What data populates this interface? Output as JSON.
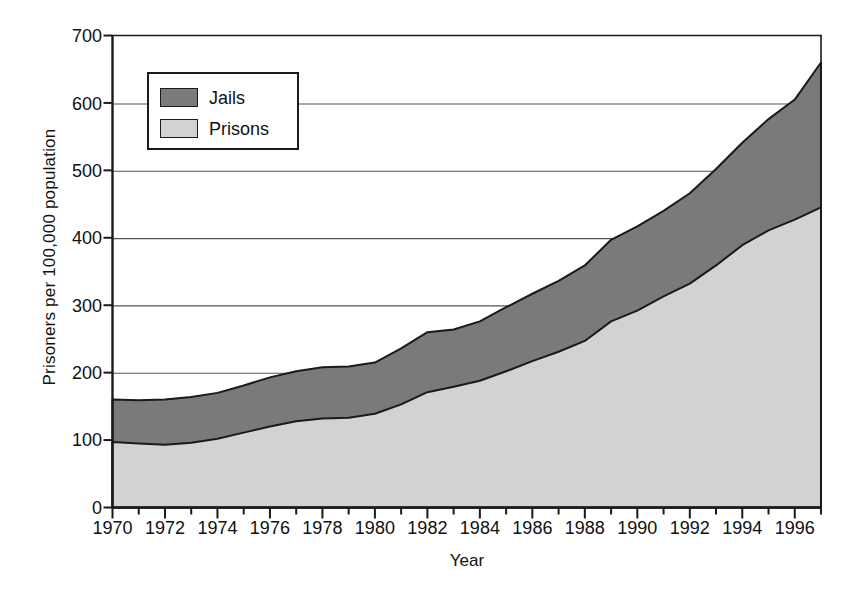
{
  "chart_data": {
    "type": "area",
    "title": "",
    "xlabel": "Year",
    "ylabel": "Prisoners per 100,000 population",
    "xlim": [
      1970,
      1997
    ],
    "ylim": [
      0,
      700
    ],
    "yticks": [
      0,
      100,
      200,
      300,
      400,
      500,
      600,
      700
    ],
    "xticks": [
      1970,
      1972,
      1974,
      1976,
      1978,
      1980,
      1982,
      1984,
      1986,
      1988,
      1990,
      1992,
      1994,
      1996
    ],
    "xtick_labels": [
      "1970",
      "1972",
      "1974",
      "1976",
      "1978",
      "1980",
      "1982",
      "1984",
      "1986",
      "1988",
      "1990",
      "1992",
      "1994",
      "1996"
    ],
    "ytick_labels": [
      "0",
      "100",
      "200",
      "300",
      "400",
      "500",
      "600",
      "700"
    ],
    "grid": "horizontal",
    "stacked": true,
    "legend_position": "top-left-inside",
    "x": [
      1970,
      1971,
      1972,
      1973,
      1974,
      1975,
      1976,
      1977,
      1978,
      1979,
      1980,
      1981,
      1982,
      1983,
      1984,
      1985,
      1986,
      1987,
      1988,
      1989,
      1990,
      1991,
      1992,
      1993,
      1994,
      1995,
      1996,
      1997
    ],
    "series": [
      {
        "name": "Prisons",
        "color": "#d2d2d2",
        "values": [
          97,
          95,
          93,
          96,
          102,
          111,
          120,
          128,
          132,
          133,
          139,
          153,
          171,
          179,
          188,
          202,
          217,
          231,
          247,
          276,
          292,
          313,
          332,
          359,
          389,
          411,
          427,
          445
        ]
      },
      {
        "name": "Jails",
        "color": "#7a7a7a",
        "values": [
          63,
          64,
          67,
          68,
          68,
          70,
          73,
          74,
          76,
          76,
          76,
          83,
          89,
          85,
          88,
          95,
          100,
          105,
          112,
          121,
          125,
          127,
          134,
          143,
          152,
          165,
          178,
          215
        ]
      }
    ],
    "totals": [
      160,
      159,
      160,
      164,
      170,
      181,
      193,
      202,
      208,
      209,
      215,
      236,
      260,
      264,
      276,
      297,
      317,
      336,
      359,
      397,
      417,
      440,
      466,
      502,
      541,
      576,
      605,
      660
    ]
  },
  "legend": {
    "items": [
      {
        "label": "Jails",
        "color": "#7a7a7a"
      },
      {
        "label": "Prisons",
        "color": "#d2d2d2"
      }
    ]
  },
  "axes": {
    "x_title": "Year",
    "y_title": "Prisoners per 100,000 population"
  }
}
